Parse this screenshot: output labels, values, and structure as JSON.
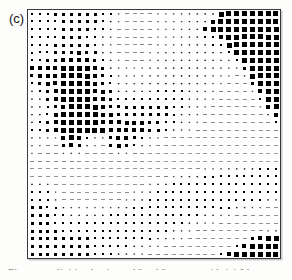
{
  "figure": {
    "panel_label": "(c)",
    "caption_partial": "Figure    —    digitized using a 16 × 16 square grid. (c) Iden…",
    "frame_color": "#3a3a3a",
    "background_color": "#ffffff",
    "marker_color": "#000000"
  },
  "chart_data": {
    "type": "heatmap",
    "title": "(c)",
    "subtitle": "",
    "xlabel": "",
    "ylabel": "",
    "legend": [],
    "annotations": [],
    "grid": false,
    "rows": 32,
    "cols": 32,
    "xlim": [
      0,
      32
    ],
    "ylim": [
      0,
      32
    ],
    "xtick_labels": [],
    "ytick_labels": [],
    "value_range": [
      0,
      1
    ],
    "marker_shape": "filled-square",
    "encoding": "square area proportional to magnitude (Hinton diagram)",
    "values": [
      [
        0.34,
        0.34,
        0.34,
        0.38,
        0.38,
        0.38,
        0.38,
        0.38,
        0.38,
        0.34,
        0.3,
        0.18,
        0.14,
        0.12,
        0.12,
        0.14,
        0.16,
        0.16,
        0.18,
        0.2,
        0.22,
        0.24,
        0.26,
        0.28,
        0.72,
        0.8,
        0.82,
        0.84,
        0.84,
        0.84,
        0.84,
        0.82
      ],
      [
        0.34,
        0.34,
        0.34,
        0.36,
        0.38,
        0.38,
        0.38,
        0.38,
        0.38,
        0.34,
        0.28,
        0.16,
        0.12,
        0.12,
        0.12,
        0.14,
        0.16,
        0.16,
        0.18,
        0.2,
        0.22,
        0.24,
        0.26,
        0.62,
        0.78,
        0.8,
        0.82,
        0.84,
        0.84,
        0.84,
        0.84,
        0.82
      ],
      [
        0.32,
        0.32,
        0.34,
        0.36,
        0.38,
        0.38,
        0.38,
        0.38,
        0.36,
        0.32,
        0.24,
        0.14,
        0.12,
        0.12,
        0.12,
        0.14,
        0.16,
        0.16,
        0.18,
        0.2,
        0.22,
        0.24,
        0.58,
        0.76,
        0.78,
        0.8,
        0.82,
        0.84,
        0.84,
        0.84,
        0.82,
        0.8
      ],
      [
        0.32,
        0.32,
        0.34,
        0.36,
        0.38,
        0.38,
        0.38,
        0.36,
        0.34,
        0.28,
        0.2,
        0.13,
        0.12,
        0.12,
        0.12,
        0.14,
        0.16,
        0.16,
        0.18,
        0.2,
        0.22,
        0.26,
        0.3,
        0.34,
        0.7,
        0.78,
        0.82,
        0.84,
        0.84,
        0.84,
        0.82,
        0.8
      ],
      [
        0.32,
        0.34,
        0.36,
        0.38,
        0.38,
        0.4,
        0.4,
        0.38,
        0.34,
        0.26,
        0.18,
        0.13,
        0.12,
        0.12,
        0.13,
        0.15,
        0.17,
        0.18,
        0.2,
        0.22,
        0.24,
        0.26,
        0.28,
        0.3,
        0.34,
        0.72,
        0.8,
        0.84,
        0.84,
        0.84,
        0.82,
        0.8
      ],
      [
        0.32,
        0.34,
        0.36,
        0.4,
        0.44,
        0.52,
        0.56,
        0.48,
        0.38,
        0.28,
        0.2,
        0.14,
        0.13,
        0.13,
        0.14,
        0.16,
        0.18,
        0.2,
        0.22,
        0.24,
        0.26,
        0.26,
        0.26,
        0.26,
        0.26,
        0.34,
        0.74,
        0.82,
        0.84,
        0.84,
        0.82,
        0.8
      ],
      [
        0.34,
        0.36,
        0.4,
        0.52,
        0.62,
        0.68,
        0.7,
        0.62,
        0.48,
        0.34,
        0.24,
        0.16,
        0.14,
        0.14,
        0.15,
        0.17,
        0.2,
        0.22,
        0.24,
        0.26,
        0.26,
        0.26,
        0.26,
        0.24,
        0.22,
        0.2,
        0.3,
        0.74,
        0.82,
        0.84,
        0.82,
        0.8
      ],
      [
        0.54,
        0.56,
        0.6,
        0.68,
        0.74,
        0.78,
        0.78,
        0.72,
        0.58,
        0.42,
        0.28,
        0.18,
        0.16,
        0.16,
        0.17,
        0.2,
        0.22,
        0.24,
        0.26,
        0.28,
        0.28,
        0.26,
        0.24,
        0.22,
        0.2,
        0.18,
        0.18,
        0.46,
        0.78,
        0.82,
        0.82,
        0.8
      ],
      [
        0.52,
        0.54,
        0.6,
        0.7,
        0.78,
        0.8,
        0.8,
        0.74,
        0.62,
        0.46,
        0.32,
        0.2,
        0.18,
        0.18,
        0.2,
        0.22,
        0.24,
        0.26,
        0.28,
        0.28,
        0.28,
        0.26,
        0.24,
        0.2,
        0.18,
        0.16,
        0.15,
        0.22,
        0.72,
        0.82,
        0.82,
        0.8
      ],
      [
        0.34,
        0.4,
        0.54,
        0.68,
        0.78,
        0.8,
        0.8,
        0.76,
        0.64,
        0.5,
        0.36,
        0.24,
        0.2,
        0.2,
        0.22,
        0.24,
        0.26,
        0.28,
        0.28,
        0.28,
        0.28,
        0.26,
        0.22,
        0.18,
        0.16,
        0.14,
        0.13,
        0.14,
        0.42,
        0.8,
        0.82,
        0.8
      ],
      [
        0.26,
        0.3,
        0.44,
        0.62,
        0.74,
        0.8,
        0.8,
        0.78,
        0.68,
        0.54,
        0.4,
        0.28,
        0.24,
        0.24,
        0.26,
        0.28,
        0.3,
        0.3,
        0.3,
        0.3,
        0.28,
        0.24,
        0.2,
        0.17,
        0.15,
        0.13,
        0.12,
        0.13,
        0.16,
        0.66,
        0.82,
        0.8
      ],
      [
        0.24,
        0.26,
        0.38,
        0.56,
        0.72,
        0.8,
        0.8,
        0.78,
        0.7,
        0.58,
        0.46,
        0.34,
        0.3,
        0.3,
        0.32,
        0.34,
        0.34,
        0.34,
        0.32,
        0.3,
        0.26,
        0.22,
        0.18,
        0.16,
        0.14,
        0.12,
        0.12,
        0.12,
        0.13,
        0.34,
        0.78,
        0.8
      ],
      [
        0.24,
        0.26,
        0.34,
        0.52,
        0.7,
        0.8,
        0.82,
        0.8,
        0.72,
        0.62,
        0.52,
        0.42,
        0.38,
        0.38,
        0.4,
        0.4,
        0.4,
        0.38,
        0.34,
        0.3,
        0.26,
        0.2,
        0.17,
        0.15,
        0.13,
        0.12,
        0.12,
        0.12,
        0.12,
        0.16,
        0.58,
        0.78
      ],
      [
        0.26,
        0.28,
        0.36,
        0.54,
        0.72,
        0.82,
        0.82,
        0.8,
        0.74,
        0.66,
        0.58,
        0.5,
        0.48,
        0.48,
        0.48,
        0.46,
        0.42,
        0.38,
        0.32,
        0.28,
        0.22,
        0.18,
        0.15,
        0.14,
        0.13,
        0.12,
        0.12,
        0.12,
        0.12,
        0.13,
        0.26,
        0.62
      ],
      [
        0.28,
        0.32,
        0.44,
        0.62,
        0.76,
        0.82,
        0.82,
        0.8,
        0.76,
        0.7,
        0.64,
        0.58,
        0.56,
        0.56,
        0.54,
        0.5,
        0.44,
        0.36,
        0.3,
        0.24,
        0.19,
        0.16,
        0.14,
        0.13,
        0.12,
        0.12,
        0.12,
        0.12,
        0.12,
        0.12,
        0.14,
        0.3
      ],
      [
        0.3,
        0.34,
        0.46,
        0.64,
        0.78,
        0.82,
        0.82,
        0.8,
        0.78,
        0.74,
        0.68,
        0.62,
        0.6,
        0.58,
        0.54,
        0.48,
        0.4,
        0.32,
        0.26,
        0.2,
        0.17,
        0.15,
        0.13,
        0.12,
        0.12,
        0.12,
        0.12,
        0.12,
        0.12,
        0.12,
        0.12,
        0.14
      ],
      [
        0.22,
        0.2,
        0.18,
        0.16,
        0.6,
        0.76,
        0.6,
        0.34,
        0.2,
        0.18,
        0.52,
        0.66,
        0.62,
        0.48,
        0.3,
        0.2,
        0.16,
        0.14,
        0.13,
        0.13,
        0.12,
        0.12,
        0.12,
        0.12,
        0.12,
        0.12,
        0.12,
        0.12,
        0.12,
        0.12,
        0.12,
        0.12
      ],
      [
        0.2,
        0.18,
        0.15,
        0.14,
        0.44,
        0.7,
        0.5,
        0.24,
        0.16,
        0.15,
        0.38,
        0.58,
        0.52,
        0.36,
        0.22,
        0.16,
        0.14,
        0.13,
        0.12,
        0.12,
        0.12,
        0.12,
        0.12,
        0.11,
        0.11,
        0.11,
        0.11,
        0.11,
        0.11,
        0.11,
        0.11,
        0.11
      ],
      [
        0.16,
        0.15,
        0.13,
        0.13,
        0.17,
        0.22,
        0.18,
        0.14,
        0.13,
        0.13,
        0.15,
        0.18,
        0.17,
        0.15,
        0.13,
        0.12,
        0.12,
        0.12,
        0.11,
        0.11,
        0.11,
        0.11,
        0.11,
        0.1,
        0.1,
        0.1,
        0.1,
        0.1,
        0.1,
        0.1,
        0.1,
        0.1
      ],
      [
        0.14,
        0.13,
        0.12,
        0.12,
        0.13,
        0.14,
        0.13,
        0.12,
        0.12,
        0.12,
        0.12,
        0.13,
        0.13,
        0.12,
        0.12,
        0.11,
        0.11,
        0.11,
        0.11,
        0.1,
        0.1,
        0.1,
        0.1,
        0.1,
        0.1,
        0.1,
        0.1,
        0.1,
        0.1,
        0.1,
        0.1,
        0.1
      ],
      [
        0.12,
        0.12,
        0.11,
        0.11,
        0.11,
        0.11,
        0.11,
        0.11,
        0.11,
        0.11,
        0.11,
        0.11,
        0.11,
        0.11,
        0.11,
        0.11,
        0.11,
        0.11,
        0.11,
        0.12,
        0.13,
        0.14,
        0.16,
        0.18,
        0.2,
        0.22,
        0.24,
        0.26,
        0.28,
        0.3,
        0.3,
        0.3
      ],
      [
        0.12,
        0.12,
        0.11,
        0.11,
        0.11,
        0.11,
        0.11,
        0.11,
        0.11,
        0.11,
        0.11,
        0.11,
        0.11,
        0.11,
        0.11,
        0.12,
        0.13,
        0.15,
        0.18,
        0.22,
        0.26,
        0.28,
        0.3,
        0.32,
        0.34,
        0.34,
        0.34,
        0.36,
        0.36,
        0.36,
        0.36,
        0.34
      ],
      [
        0.26,
        0.26,
        0.24,
        0.13,
        0.12,
        0.12,
        0.11,
        0.11,
        0.11,
        0.11,
        0.11,
        0.11,
        0.11,
        0.12,
        0.14,
        0.18,
        0.24,
        0.28,
        0.32,
        0.34,
        0.36,
        0.36,
        0.36,
        0.36,
        0.36,
        0.36,
        0.36,
        0.36,
        0.36,
        0.36,
        0.36,
        0.34
      ],
      [
        0.32,
        0.32,
        0.3,
        0.16,
        0.12,
        0.12,
        0.11,
        0.11,
        0.11,
        0.11,
        0.11,
        0.12,
        0.13,
        0.16,
        0.2,
        0.26,
        0.3,
        0.34,
        0.36,
        0.36,
        0.36,
        0.36,
        0.36,
        0.36,
        0.36,
        0.36,
        0.36,
        0.36,
        0.36,
        0.36,
        0.34,
        0.32
      ],
      [
        0.36,
        0.36,
        0.34,
        0.22,
        0.14,
        0.13,
        0.12,
        0.12,
        0.12,
        0.12,
        0.13,
        0.15,
        0.18,
        0.22,
        0.26,
        0.3,
        0.34,
        0.36,
        0.36,
        0.36,
        0.36,
        0.36,
        0.36,
        0.36,
        0.36,
        0.36,
        0.36,
        0.34,
        0.32,
        0.3,
        0.26,
        0.22
      ],
      [
        0.38,
        0.38,
        0.36,
        0.3,
        0.24,
        0.2,
        0.18,
        0.17,
        0.17,
        0.18,
        0.2,
        0.22,
        0.26,
        0.3,
        0.32,
        0.34,
        0.36,
        0.36,
        0.36,
        0.36,
        0.36,
        0.36,
        0.36,
        0.34,
        0.32,
        0.3,
        0.26,
        0.22,
        0.18,
        0.16,
        0.14,
        0.13
      ],
      [
        0.38,
        0.38,
        0.38,
        0.34,
        0.3,
        0.28,
        0.26,
        0.26,
        0.26,
        0.28,
        0.3,
        0.32,
        0.34,
        0.34,
        0.36,
        0.36,
        0.36,
        0.36,
        0.36,
        0.36,
        0.34,
        0.32,
        0.28,
        0.24,
        0.2,
        0.17,
        0.15,
        0.14,
        0.13,
        0.13,
        0.12,
        0.12
      ],
      [
        0.38,
        0.38,
        0.38,
        0.36,
        0.34,
        0.32,
        0.32,
        0.32,
        0.32,
        0.34,
        0.34,
        0.36,
        0.36,
        0.36,
        0.36,
        0.36,
        0.36,
        0.36,
        0.34,
        0.3,
        0.26,
        0.22,
        0.18,
        0.16,
        0.14,
        0.13,
        0.12,
        0.12,
        0.12,
        0.12,
        0.12,
        0.13
      ],
      [
        0.38,
        0.38,
        0.38,
        0.38,
        0.36,
        0.36,
        0.36,
        0.36,
        0.36,
        0.36,
        0.36,
        0.36,
        0.36,
        0.36,
        0.36,
        0.36,
        0.34,
        0.3,
        0.26,
        0.21,
        0.18,
        0.15,
        0.14,
        0.13,
        0.12,
        0.12,
        0.12,
        0.12,
        0.12,
        0.13,
        0.16,
        0.22
      ],
      [
        0.38,
        0.38,
        0.38,
        0.38,
        0.38,
        0.38,
        0.38,
        0.38,
        0.36,
        0.36,
        0.36,
        0.36,
        0.36,
        0.36,
        0.34,
        0.3,
        0.26,
        0.22,
        0.18,
        0.16,
        0.14,
        0.13,
        0.12,
        0.12,
        0.12,
        0.12,
        0.12,
        0.13,
        0.4,
        0.68,
        0.76,
        0.78
      ],
      [
        0.38,
        0.38,
        0.38,
        0.38,
        0.38,
        0.38,
        0.38,
        0.38,
        0.36,
        0.36,
        0.36,
        0.34,
        0.32,
        0.28,
        0.24,
        0.2,
        0.17,
        0.15,
        0.14,
        0.13,
        0.12,
        0.12,
        0.12,
        0.12,
        0.12,
        0.12,
        0.34,
        0.7,
        0.8,
        0.82,
        0.82,
        0.82
      ],
      [
        0.38,
        0.38,
        0.38,
        0.38,
        0.38,
        0.38,
        0.38,
        0.38,
        0.36,
        0.34,
        0.32,
        0.28,
        0.24,
        0.2,
        0.17,
        0.15,
        0.14,
        0.13,
        0.12,
        0.12,
        0.12,
        0.12,
        0.12,
        0.12,
        0.3,
        0.7,
        0.8,
        0.82,
        0.82,
        0.82,
        0.82,
        0.82
      ]
    ]
  }
}
